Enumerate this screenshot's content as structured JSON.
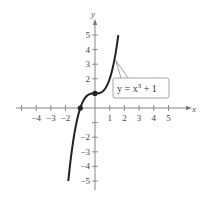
{
  "chart_data": {
    "type": "line",
    "title": "",
    "function": "y = x^3 + 1",
    "xlabel": "x",
    "ylabel": "y",
    "xlim": [
      -5,
      5
    ],
    "ylim": [
      -5,
      5
    ],
    "grid": false,
    "x_ticks": [
      -5,
      -4,
      -3,
      -2,
      -1,
      1,
      2,
      3,
      4,
      5
    ],
    "x_tick_labels": [
      "-4",
      "-3",
      "-2",
      "1",
      "2",
      "3",
      "4",
      "5"
    ],
    "y_ticks": [
      -5,
      -4,
      -3,
      -2,
      -1,
      1,
      2,
      3,
      4,
      5
    ],
    "y_tick_labels": [
      "5",
      "4",
      "3",
      "2",
      "-2",
      "-3",
      "-4",
      "-5"
    ],
    "series": [
      {
        "name": "y = x^3 + 1",
        "x": [
          -1.817,
          -1.5,
          -1.25,
          -1,
          -0.75,
          -0.5,
          -0.25,
          0,
          0.25,
          0.5,
          0.75,
          1,
          1.25,
          1.5,
          1.587
        ],
        "y": [
          -5,
          -2.375,
          -0.953,
          0,
          0.578,
          0.875,
          0.984,
          1,
          1.016,
          1.125,
          1.422,
          2,
          2.953,
          4.375,
          5
        ]
      }
    ],
    "marked_points": [
      {
        "x": -1,
        "y": 0
      },
      {
        "x": 0,
        "y": 1
      }
    ],
    "annotations": [
      {
        "text_parts": [
          "y = x",
          "3",
          " + 1"
        ],
        "points_to": {
          "x": 1.35,
          "y": 3.4
        }
      }
    ]
  },
  "labels": {
    "x_axis": "x",
    "y_axis": "y",
    "callout_main": "y = x",
    "callout_exp": "3",
    "callout_tail": " + 1"
  }
}
